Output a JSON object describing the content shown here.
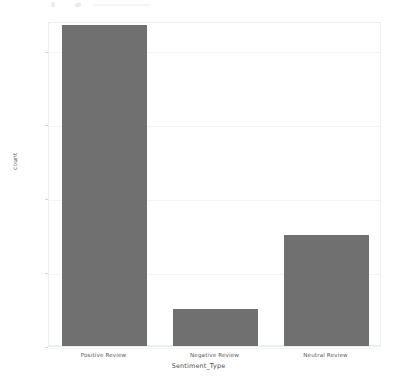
{
  "chart_data": {
    "type": "bar",
    "title": "",
    "subtitle": "",
    "xlabel": "Sentiment_Type",
    "ylabel": "count",
    "categories": [
      "Positive Review",
      "Negative Review",
      "Neutral Review"
    ],
    "values": [
      87000,
      10000,
      30000
    ],
    "ylim": [
      0,
      88000
    ],
    "yticks": [
      0,
      20000,
      40000,
      60000,
      80000
    ],
    "ytick_labels": [
      "0",
      "20000",
      "40000",
      "60000",
      "80000"
    ],
    "grid": true,
    "legend": "none",
    "bar_color": "#707070",
    "background_color": "#ffffff",
    "axis_frame_color": "#eceff1",
    "gridline_color": "#f2f4f5"
  },
  "axes": {
    "y_title": "count",
    "x_title": "Sentiment_Type"
  }
}
